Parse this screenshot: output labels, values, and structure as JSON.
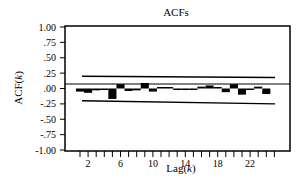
{
  "chart_data": {
    "type": "bar",
    "title": "ACFs",
    "xlabel": "Lag(k)",
    "ylabel": "ACF(k)",
    "ylim": [
      -1.0,
      1.0
    ],
    "yticks": [
      "1.00",
      ".75",
      ".50",
      ".25",
      ".00",
      "-.25",
      "-.50",
      "-.75",
      "-1.00"
    ],
    "ytick_values": [
      1.0,
      0.75,
      0.5,
      0.25,
      0.0,
      -0.25,
      -0.5,
      -0.75,
      -1.0
    ],
    "xticks": [
      "2",
      "6",
      "10",
      "14",
      "18",
      "22"
    ],
    "xtick_values": [
      2,
      6,
      10,
      14,
      18,
      22
    ],
    "x_minor_ticks": [
      1,
      2,
      3,
      4,
      5,
      6,
      7,
      8,
      9,
      10,
      11,
      12,
      13,
      14,
      15,
      16,
      17,
      18,
      19,
      20,
      21,
      22,
      23,
      24,
      25
    ],
    "grid": false,
    "legend": null,
    "categories": [
      1,
      2,
      3,
      4,
      5,
      6,
      7,
      8,
      9,
      10,
      11,
      12,
      13,
      14,
      15,
      16,
      17,
      18,
      19,
      20,
      21,
      22,
      23,
      24
    ],
    "values": [
      -0.05,
      -0.07,
      -0.03,
      -0.01,
      -0.17,
      0.07,
      -0.04,
      -0.03,
      0.09,
      -0.05,
      0.0,
      0.01,
      -0.02,
      -0.01,
      -0.01,
      0.03,
      0.05,
      0.02,
      -0.06,
      0.07,
      -0.1,
      -0.02,
      0.03,
      -0.09
    ],
    "confidence_bounds": {
      "upper": {
        "start": 0.2,
        "end": 0.18
      },
      "lower": {
        "start": -0.2,
        "end": -0.25
      }
    }
  }
}
